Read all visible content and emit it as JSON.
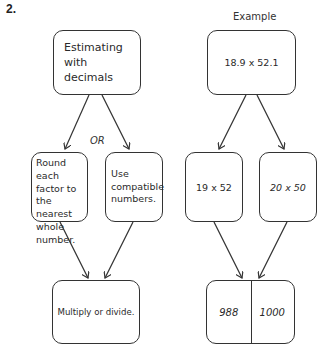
{
  "problem_number": "2.",
  "left_flow": {
    "top": "Estimating with decimals",
    "or_label": "OR",
    "option_a": "Round each factor to the nearest whole number.",
    "option_b": "Use compatible numbers.",
    "bottom": "Multiply or divide."
  },
  "right_flow": {
    "heading": "Example",
    "top": "18.9 x 52.1",
    "option_a": "19 x 52",
    "option_b": "20 x 50",
    "result_a": "988",
    "result_b": "1000"
  }
}
